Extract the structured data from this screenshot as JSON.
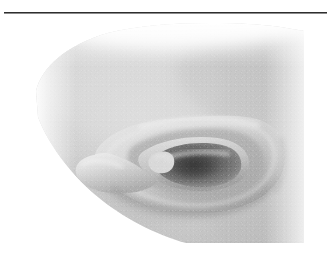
{
  "page": {
    "background_color": "#ffffff",
    "rule": {
      "name": "horizontal-rule",
      "color": "#2e2e2e",
      "x": 4,
      "y": 12,
      "width": 323,
      "height": 1
    }
  },
  "figure": {
    "type": "photograph",
    "subject": "human ear",
    "view": "lateral profile, rotated",
    "rendering": "black and white halftone / grayscale scan",
    "caption": "",
    "alt_text": "Grayscale photograph of a human ear seen in profile against the side of the head",
    "plate": {
      "x": 36,
      "y": 21,
      "width": 268,
      "height": 222,
      "edge_style": "soft vignette, rounded upper-left and lower-left corners"
    },
    "tones": {
      "background": "#ffffff",
      "skin_base": "#c9c9c9",
      "skin_light": "#dedede",
      "skin_highlight": "#efefef",
      "skin_shadow": "#a8a8a8",
      "crease_shadow": "#8a8a8a",
      "concha_dark": "#5a5a5a",
      "canal_darkest": "#3f3f3f"
    },
    "anatomy": [
      {
        "name": "helix",
        "label": "Helix",
        "note": "outer curled rim forming the large arc on the right"
      },
      {
        "name": "antihelix",
        "label": "Antihelix",
        "note": "inner ridge paralleling the helix"
      },
      {
        "name": "concha",
        "label": "Concha",
        "note": "deep bowl, darkest region near the centre"
      },
      {
        "name": "external-acoustic-meatus",
        "label": "Ear canal",
        "note": "darkest shadow at the centre of the concha"
      },
      {
        "name": "tragus",
        "label": "Tragus",
        "note": "small flap anterior to the canal"
      },
      {
        "name": "lobule",
        "label": "Lobule",
        "note": "soft lower tip extending to the left"
      },
      {
        "name": "cheek",
        "label": "Cheek / temple",
        "note": "broad light field occupying the upper-left of the plate"
      },
      {
        "name": "jawline",
        "label": "Jaw line",
        "note": "diagonal edge descending across the lower-left"
      }
    ]
  }
}
